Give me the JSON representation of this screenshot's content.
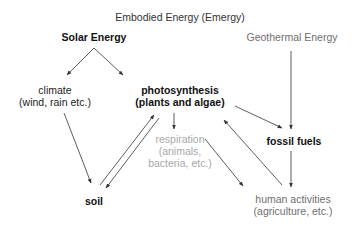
{
  "diagram": {
    "title": "Embodied Energy (Emergy)",
    "nodes": {
      "solar": {
        "line1": "Solar Energy"
      },
      "geothermal": {
        "line1": "Geothermal Energy"
      },
      "climate": {
        "line1": "climate",
        "line2": "(wind, rain etc.)"
      },
      "photosynthesis": {
        "line1": "photosynthesis",
        "line2": "(plants and algae)"
      },
      "respiration": {
        "line1": "respiration",
        "line2": "(animals,",
        "line3": "bacteria, etc.)"
      },
      "fossil_fuels": {
        "line1": "fossil fuels"
      },
      "soil": {
        "line1": "soil"
      },
      "human": {
        "line1": "human activities",
        "line2": "(agriculture, etc.)"
      }
    },
    "edges": [
      {
        "from": "Solar Energy",
        "to": "climate"
      },
      {
        "from": "Solar Energy",
        "to": "photosynthesis"
      },
      {
        "from": "Geothermal Energy",
        "to": "fossil fuels"
      },
      {
        "from": "climate",
        "to": "soil"
      },
      {
        "from": "soil",
        "to": "photosynthesis"
      },
      {
        "from": "photosynthesis",
        "to": "soil"
      },
      {
        "from": "photosynthesis",
        "to": "respiration"
      },
      {
        "from": "photosynthesis",
        "to": "fossil fuels"
      },
      {
        "from": "fossil fuels",
        "to": "human activities"
      },
      {
        "from": "respiration",
        "to": "human activities"
      },
      {
        "from": "human activities",
        "to": "photosynthesis"
      }
    ],
    "colors": {
      "primary_text": "#111111",
      "secondary_text": "#6e6e6e",
      "tertiary_text": "#a8a8a8",
      "arrow": "#333333"
    }
  }
}
